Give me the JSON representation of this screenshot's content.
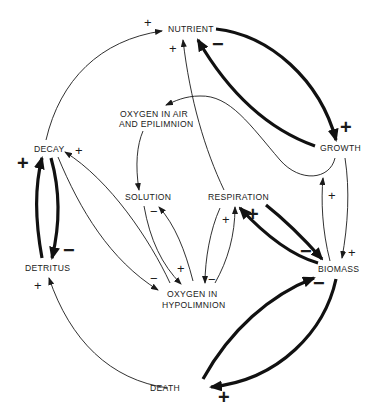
{
  "diagram": {
    "type": "causal-loop",
    "nodes": {
      "nutrient": "NUTRIENT",
      "growth": "GROWTH",
      "oxygen_air_1": "OXYGEN IN AIR",
      "oxygen_air_2": "AND EPILIMNION",
      "decay": "DECAY",
      "solution": "SOLUTION",
      "respiration": "RESPIRATION",
      "detritus": "DETRITUS",
      "biomass": "BIOMASS",
      "oxygen_hypo_1": "OXYGEN IN",
      "oxygen_hypo_2": "HYPOLIMNION",
      "death": "DEATH"
    },
    "links": [
      {
        "from": "DECAY",
        "to": "NUTRIENT",
        "sign": "+",
        "weight": "thin"
      },
      {
        "from": "NUTRIENT",
        "to": "GROWTH",
        "sign": "+",
        "weight": "thick"
      },
      {
        "from": "GROWTH",
        "to": "NUTRIENT",
        "sign": "-",
        "weight": "thick"
      },
      {
        "from": "RESPIRATION",
        "to": "NUTRIENT",
        "sign": "+",
        "weight": "thin"
      },
      {
        "from": "GROWTH",
        "to": "OXYGEN IN AIR AND EPILIMNION",
        "sign": "",
        "weight": "thin"
      },
      {
        "from": "OXYGEN IN AIR AND EPILIMNION",
        "to": "SOLUTION",
        "sign": "",
        "weight": "thin"
      },
      {
        "from": "GROWTH",
        "to": "BIOMASS",
        "sign": "+",
        "weight": "thin"
      },
      {
        "from": "BIOMASS",
        "to": "GROWTH",
        "sign": "+",
        "weight": "thin"
      },
      {
        "from": "DECAY",
        "to": "DETRITUS",
        "sign": "-",
        "weight": "thick"
      },
      {
        "from": "DETRITUS",
        "to": "DECAY",
        "sign": "+",
        "weight": "thick"
      },
      {
        "from": "OXYGEN IN HYPOLIMNION",
        "to": "DECAY",
        "sign": "+",
        "weight": "thin"
      },
      {
        "from": "DECAY",
        "to": "OXYGEN IN HYPOLIMNION",
        "sign": "-",
        "weight": "thin"
      },
      {
        "from": "SOLUTION",
        "to": "OXYGEN IN HYPOLIMNION",
        "sign": "+",
        "weight": "thin"
      },
      {
        "from": "OXYGEN IN HYPOLIMNION",
        "to": "SOLUTION",
        "sign": "-",
        "weight": "thin"
      },
      {
        "from": "OXYGEN IN HYPOLIMNION",
        "to": "RESPIRATION",
        "sign": "+",
        "weight": "thin"
      },
      {
        "from": "RESPIRATION",
        "to": "OXYGEN IN HYPOLIMNION",
        "sign": "-",
        "weight": "thin"
      },
      {
        "from": "BIOMASS",
        "to": "RESPIRATION",
        "sign": "+",
        "weight": "thick"
      },
      {
        "from": "RESPIRATION",
        "to": "BIOMASS",
        "sign": "-",
        "weight": "thick"
      },
      {
        "from": "BIOMASS",
        "to": "DEATH",
        "sign": "+",
        "weight": "thick"
      },
      {
        "from": "DEATH",
        "to": "BIOMASS",
        "sign": "-",
        "weight": "thick"
      },
      {
        "from": "DEATH",
        "to": "DETRITUS",
        "sign": "+",
        "weight": "thin"
      }
    ],
    "signs": {
      "plus": "+",
      "minus": "−"
    }
  }
}
